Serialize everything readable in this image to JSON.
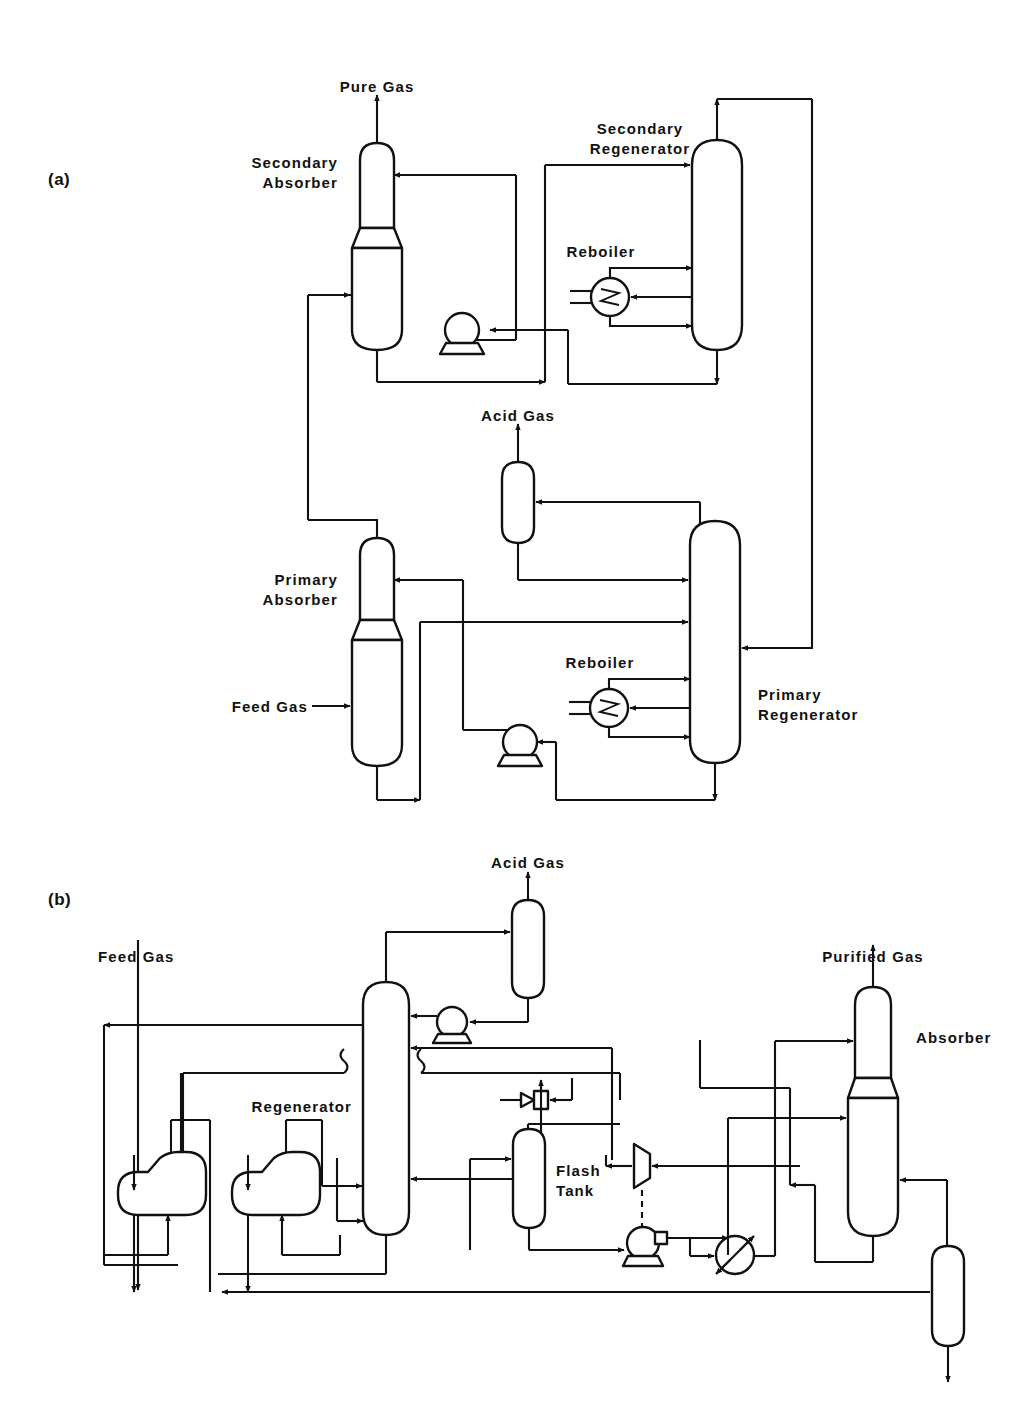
{
  "figure": {
    "panels": [
      {
        "id": "a",
        "label": "(a)"
      },
      {
        "id": "b",
        "label": "(b)"
      }
    ]
  },
  "panel_a": {
    "label": "(a)",
    "title": "Two-stage absorption / regeneration acid gas removal flowsheet",
    "streams": [
      {
        "name": "pure-gas-outlet",
        "label": "Pure Gas"
      },
      {
        "name": "acid-gas-outlet",
        "label": "Acid Gas"
      },
      {
        "name": "feed-gas-inlet",
        "label": "Feed Gas"
      }
    ],
    "equipment": [
      {
        "name": "secondary-absorber",
        "label": "Secondary\nAbsorber",
        "line1": "Secondary",
        "line2": "Absorber",
        "type": "column"
      },
      {
        "name": "secondary-regenerator",
        "label": "Secondary\nRegenerator",
        "line1": "Secondary",
        "line2": "Regenerator",
        "type": "column"
      },
      {
        "name": "secondary-reboiler",
        "label": "Reboiler",
        "line1": "Reboiler",
        "line2": "",
        "type": "reboiler"
      },
      {
        "name": "primary-absorber",
        "label": "Primary\nAbsorber",
        "line1": "Primary",
        "line2": "Absorber",
        "type": "column"
      },
      {
        "name": "primary-regenerator",
        "label": "Primary\nRegenerator",
        "line1": "Primary",
        "line2": "Regenerator",
        "type": "column"
      },
      {
        "name": "primary-reboiler",
        "label": "Reboiler",
        "line1": "Reboiler",
        "line2": "",
        "type": "reboiler"
      },
      {
        "name": "acid-gas-knockout-drum",
        "label": "",
        "line1": "",
        "line2": "",
        "type": "vessel"
      },
      {
        "name": "secondary-pump",
        "label": "",
        "line1": "",
        "line2": "",
        "type": "pump"
      },
      {
        "name": "primary-pump",
        "label": "",
        "line1": "",
        "line2": "",
        "type": "pump"
      }
    ]
  },
  "panel_b": {
    "label": "(b)",
    "title": "Single absorber flowsheet with flash tank, turbine expander and heat recovery exchangers",
    "streams": [
      {
        "name": "feed-gas-inlet",
        "label": "Feed Gas"
      },
      {
        "name": "acid-gas-outlet",
        "label": "Acid Gas"
      },
      {
        "name": "purified-gas-outlet",
        "label": "Purified Gas"
      }
    ],
    "equipment": [
      {
        "name": "regenerator",
        "label": "Regenerator",
        "line1": "Regenerator",
        "line2": "",
        "type": "column"
      },
      {
        "name": "absorber",
        "label": "Absorber",
        "line1": "Absorber",
        "line2": "",
        "type": "column"
      },
      {
        "name": "flash-tank",
        "label": "Flash\nTank",
        "line1": "Flash",
        "line2": "Tank",
        "type": "vessel"
      },
      {
        "name": "acid-gas-knockout-drum",
        "label": "",
        "line1": "",
        "line2": "",
        "type": "vessel"
      },
      {
        "name": "bottom-separator-drum",
        "label": "",
        "line1": "",
        "line2": "",
        "type": "vessel"
      },
      {
        "name": "heat-exchanger-left",
        "label": "",
        "line1": "",
        "line2": "",
        "type": "heat-exchanger"
      },
      {
        "name": "heat-exchanger-right",
        "label": "",
        "line1": "",
        "line2": "",
        "type": "heat-exchanger"
      },
      {
        "name": "reflux-pump",
        "label": "",
        "line1": "",
        "line2": "",
        "type": "pump"
      },
      {
        "name": "flash-tank-pump",
        "label": "",
        "line1": "",
        "line2": "",
        "type": "pump"
      },
      {
        "name": "hydraulic-turbine",
        "label": "",
        "line1": "",
        "line2": "",
        "type": "turbine"
      },
      {
        "name": "control-valve",
        "label": "",
        "line1": "",
        "line2": "",
        "type": "valve"
      },
      {
        "name": "cooler",
        "label": "",
        "line1": "",
        "line2": "",
        "type": "cooler"
      }
    ]
  },
  "colors": {
    "line": "#111111",
    "background": "#ffffff",
    "text": "#111111"
  }
}
